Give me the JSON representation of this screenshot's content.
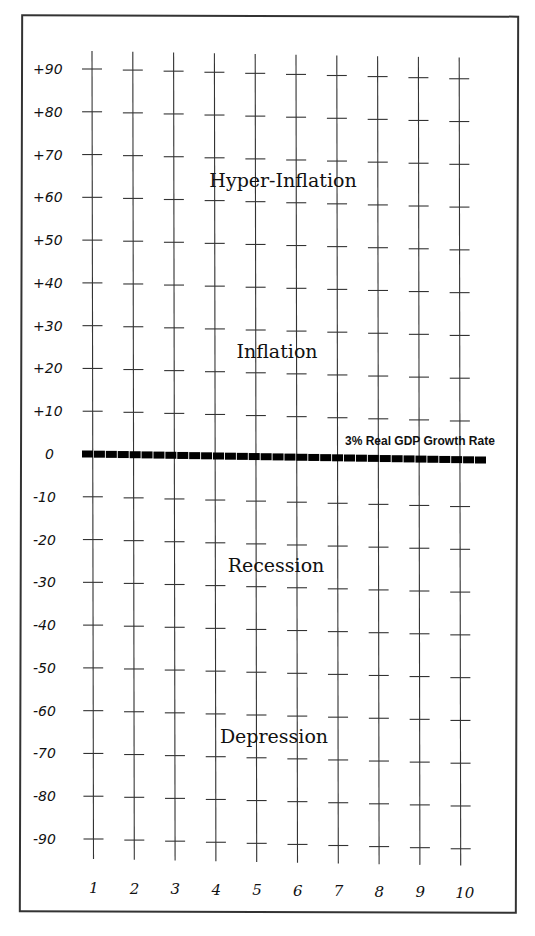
{
  "chart_data": {
    "type": "diagram",
    "title": "",
    "y_ticks": [
      "+90",
      "+80",
      "+70",
      "+60",
      "+50",
      "+40",
      "+30",
      "+20",
      "+10",
      "0",
      "-10",
      "-20",
      "-30",
      "-40",
      "-50",
      "-60",
      "-70",
      "-80",
      "-90"
    ],
    "y_values": [
      90,
      80,
      70,
      60,
      50,
      40,
      30,
      20,
      10,
      0,
      -10,
      -20,
      -30,
      -40,
      -50,
      -60,
      -70,
      -80,
      -90
    ],
    "x_ticks": [
      "1",
      "2",
      "3",
      "4",
      "5",
      "6",
      "7",
      "8",
      "9",
      "10"
    ],
    "ylim": [
      -90,
      90
    ],
    "baseline": {
      "value": 0,
      "label": "3% Real GDP Growth Rate",
      "style": "dashed"
    },
    "regions": [
      {
        "label": "Hyper-Inflation",
        "y": 65
      },
      {
        "label": "Inflation",
        "y": 25
      },
      {
        "label": "Recession",
        "y": -25
      },
      {
        "label": "Depression",
        "y": -65
      }
    ]
  },
  "colors": {
    "line": "#333333",
    "dash": "#000000",
    "text": "#111111"
  }
}
